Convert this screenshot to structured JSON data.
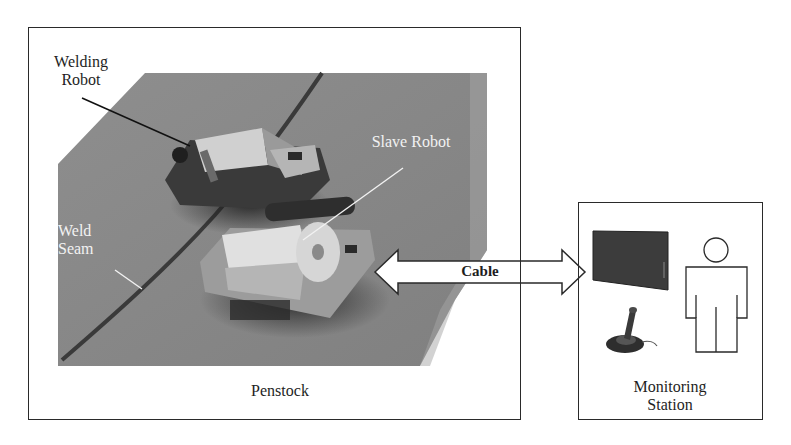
{
  "diagram": {
    "penstock_box": {
      "label": "Penstock"
    },
    "monitoring_box": {
      "label": "Monitoring\nStation"
    },
    "labels": {
      "welding_robot": "Welding\nRobot",
      "slave_robot": "Slave Robot",
      "weld_seam": "Weld\nSeam",
      "cable": "Cable"
    },
    "icons": [
      "monitor-icon",
      "joystick-icon",
      "operator-person-icon"
    ],
    "colors": {
      "frame": "#2a2a2a",
      "pipe_surface": "#8a8a8a",
      "weld_seam": "#3a3a3a",
      "arrow_fill": "#ffffff",
      "monitor": "#3c3c3c"
    }
  }
}
